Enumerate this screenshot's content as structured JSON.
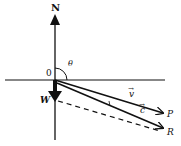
{
  "diagram": {
    "type": "vector-diagram",
    "labels": {
      "north": "N",
      "origin": "0",
      "angle": "θ",
      "wind": "W",
      "velocity_vec": "v",
      "resultant_vec": "c",
      "point_p": "P",
      "point_r": "R",
      "vector_arrow": "→"
    },
    "colors": {
      "stroke": "#111111",
      "background": "#ffffff"
    }
  }
}
